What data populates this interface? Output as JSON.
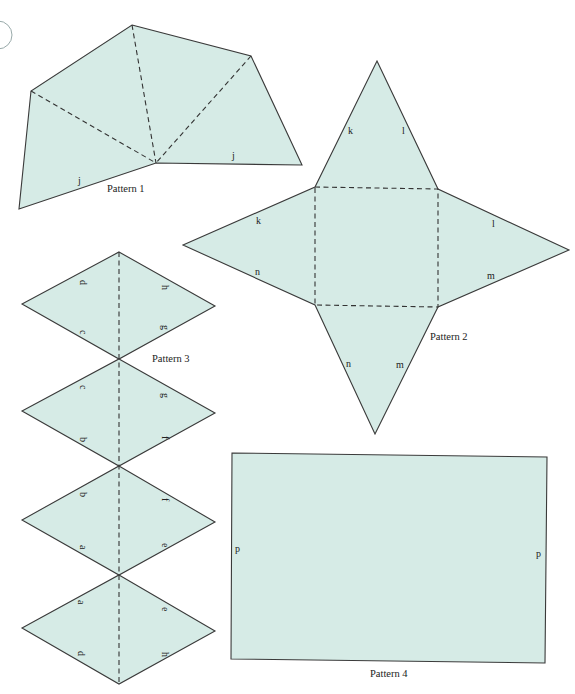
{
  "patterns": [
    {
      "id": 1,
      "caption": "Pattern 1",
      "edge_labels": [
        "j",
        "j"
      ]
    },
    {
      "id": 2,
      "caption": "Pattern 2",
      "edge_labels": [
        "k",
        "l",
        "k",
        "l",
        "n",
        "m",
        "n",
        "m"
      ]
    },
    {
      "id": 3,
      "caption": "Pattern 3",
      "edge_labels": [
        "d",
        "h",
        "c",
        "g",
        "c",
        "g",
        "b",
        "f",
        "b",
        "f",
        "a",
        "e",
        "a",
        "e",
        "d",
        "h"
      ]
    },
    {
      "id": 4,
      "caption": "Pattern 4",
      "edge_labels": [
        "p",
        "p"
      ]
    }
  ],
  "colors": {
    "fill": "#d6ebe6",
    "stroke": "#3a3a3a"
  }
}
